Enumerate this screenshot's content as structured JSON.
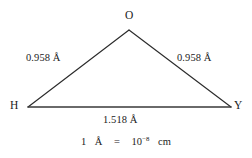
{
  "figure": {
    "type": "molecular-geometry-diagram",
    "background_color": "#ffffff",
    "line_color": "#2b2b2b",
    "text_color": "#1b1b1b",
    "vertices": [
      {
        "id": "apex",
        "label": "O",
        "x": 129,
        "y": 30
      },
      {
        "id": "left",
        "label": "H",
        "x": 28,
        "y": 107
      },
      {
        "id": "right",
        "label": "Y",
        "x": 231,
        "y": 107
      }
    ],
    "edges": [
      {
        "from": "left",
        "to": "apex",
        "length_label": "0.958 Å"
      },
      {
        "from": "apex",
        "to": "right",
        "length_label": "0.958 Å"
      },
      {
        "from": "left",
        "to": "right",
        "length_label": "1.518 Å"
      }
    ],
    "conversion": {
      "value": "1",
      "unit": "Å",
      "equals": "=",
      "result_base": "10",
      "result_exponent": "−8",
      "result_unit": "cm",
      "full_text": "1 Å = 10⁻⁸ cm"
    }
  }
}
